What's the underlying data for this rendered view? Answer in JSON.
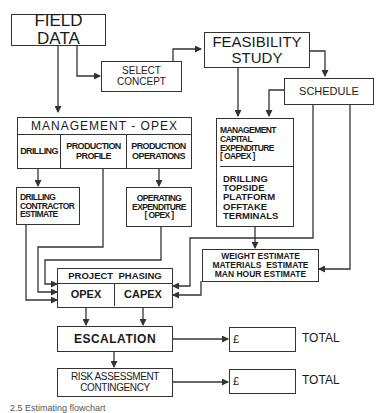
{
  "diagram": {
    "field_data": "FIELD DATA",
    "select_concept": [
      "SELECT",
      "CONCEPT"
    ],
    "feasibility_study": [
      "FEASIBILITY",
      "STUDY"
    ],
    "schedule": "SCHEDULE",
    "management_opex": {
      "title": "MANAGEMENT - OPEX",
      "cells": [
        "DRILLING",
        "PRODUCTION PROFILE",
        "PRODUCTION OPERATIONS"
      ]
    },
    "management_capex": {
      "top": [
        "MANAGEMENT",
        "CAPITAL",
        "EXPENDITURE",
        "[ OAPEX ]"
      ],
      "bottom": [
        "DRILLING",
        "TOPSIDE",
        "PLATFORM",
        "OFFTAKE",
        "TERMINALS"
      ]
    },
    "drilling_contractor": [
      "DRILLING",
      "CONTRACTOR",
      "ESTIMATE"
    ],
    "operating_expenditure": [
      "OPERATING",
      "EXPENDITURE",
      "[ OPEX ]"
    ],
    "estimates": [
      "WEIGHT ESTIMATE",
      "MATERIALS  ESTIMATE",
      "MAN HOUR ESTIMATE"
    ],
    "project_phasing": {
      "title": "PROJECT  PHASING",
      "cells": [
        "OPEX",
        "CAPEX"
      ]
    },
    "escalation": "ESCALATION",
    "risk": [
      "RISK ASSESSMENT",
      "CONTINGENCY"
    ],
    "totals": [
      {
        "currency": "£",
        "label": "TOTAL"
      },
      {
        "currency": "£",
        "label": "TOTAL"
      }
    ],
    "caption": "2.5  Estimating flowchart"
  }
}
